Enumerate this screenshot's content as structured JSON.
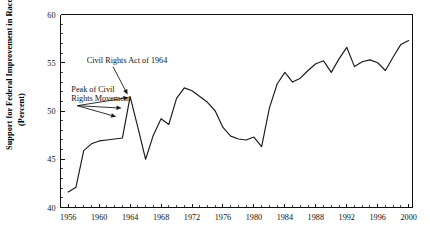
{
  "chart_data": {
    "type": "line",
    "title": "",
    "xlabel": "",
    "ylabel": "Support for Federal Improvement in Race Relations",
    "ylabel_sub": "(Percent)",
    "xlim": [
      1955,
      2000.5
    ],
    "ylim": [
      40,
      60
    ],
    "ytick_labels": [
      "40",
      "45",
      "50",
      "55",
      "60"
    ],
    "ytick_values": [
      40,
      45,
      50,
      55,
      60
    ],
    "y_minor_step": 1,
    "xtick_labels": [
      "1956",
      "1960",
      "1964",
      "1968",
      "1972",
      "1976",
      "1980",
      "1984",
      "1988",
      "1992",
      "1996",
      "2000"
    ],
    "xtick_values": [
      1956,
      1960,
      1964,
      1968,
      1972,
      1976,
      1980,
      1984,
      1988,
      1992,
      1996,
      2000
    ],
    "x_minor_step": 1,
    "grid": false,
    "legend": null,
    "series": [
      {
        "name": "Support for Federal Improvement in Race Relations",
        "color": "#1a1a1a",
        "x": [
          1956,
          1957,
          1958,
          1959,
          1960,
          1961,
          1962,
          1963,
          1964,
          1965,
          1966,
          1967,
          1968,
          1969,
          1970,
          1971,
          1972,
          1973,
          1974,
          1975,
          1976,
          1977,
          1978,
          1979,
          1980,
          1981,
          1982,
          1983,
          1984,
          1985,
          1986,
          1987,
          1988,
          1989,
          1990,
          1991,
          1992,
          1993,
          1994,
          1995,
          1996,
          1997,
          1998,
          1999,
          2000
        ],
        "y": [
          41.6,
          42.1,
          45.9,
          46.6,
          46.9,
          47.0,
          47.1,
          47.2,
          51.5,
          48.3,
          45.0,
          47.5,
          49.2,
          48.6,
          51.3,
          52.4,
          52.1,
          51.5,
          50.9,
          50.0,
          48.3,
          47.4,
          47.1,
          47.0,
          47.3,
          46.3,
          50.3,
          52.8,
          54.0,
          53.0,
          53.4,
          54.2,
          54.9,
          55.2,
          54.0,
          55.4,
          56.6,
          54.6,
          55.1,
          55.3,
          55.0,
          54.2,
          55.6,
          56.9,
          57.3
        ]
      }
    ],
    "annotations": [
      {
        "id": "civil-rights-act",
        "text": "Civil Rights Act of 1964",
        "text_x": 1963.6,
        "text_y": 55.0,
        "points_to": [
          {
            "x": 1964.0,
            "y": 51.7
          }
        ]
      },
      {
        "id": "peak-civil-rights-movement",
        "text_line1": "Peak of Civil",
        "text_line2": "Rights Movement",
        "text_x": 1956.4,
        "text_y": 52.0,
        "points_to": [
          {
            "x": 1964.0,
            "y": 51.4
          },
          {
            "x": 1963.1,
            "y": 50.3
          },
          {
            "x": 1962.4,
            "y": 49.4
          }
        ]
      }
    ]
  }
}
